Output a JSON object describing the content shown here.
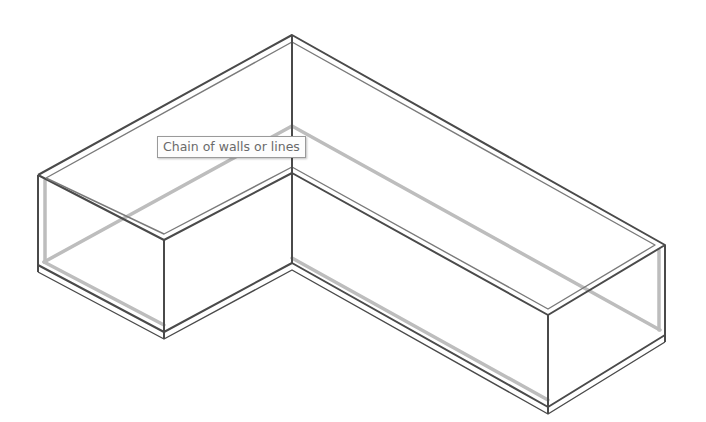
{
  "tooltip": {
    "text": "Chain of walls or lines"
  },
  "colors": {
    "edge": "#4a4a4a",
    "hidden_edge": "#b8b8b8",
    "background": "#ffffff",
    "tooltip_text": "#6a6a6a"
  },
  "model": {
    "shape": "L-shaped wall chain (isometric wireframe)",
    "vertices_top": [
      [
        292,
        35
      ],
      [
        38,
        175
      ],
      [
        164,
        240
      ],
      [
        292,
        173
      ],
      [
        548,
        315
      ],
      [
        665,
        245
      ]
    ],
    "wall_height_px": 90
  }
}
